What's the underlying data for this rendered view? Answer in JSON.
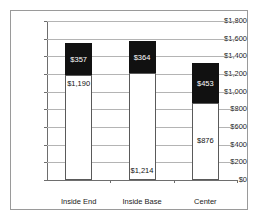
{
  "chart_data": {
    "type": "bar",
    "subtype": "stacked-bar",
    "title": "",
    "xlabel": "",
    "ylabel": "",
    "categories": [
      "Inside End",
      "Inside Base",
      "Center"
    ],
    "series": [
      {
        "name": "lower-segment",
        "color": "#ffffff",
        "values": [
          1190,
          1214,
          876
        ],
        "value_labels": [
          "$1,190",
          "$1,214",
          "$876"
        ]
      },
      {
        "name": "upper-segment",
        "color": "#111111",
        "values": [
          357,
          364,
          453
        ],
        "value_labels": [
          "$357",
          "$364",
          "$453"
        ]
      }
    ],
    "totals": [
      1547,
      1578,
      1329
    ],
    "ylim": [
      0,
      1800
    ],
    "ytick_step": 200,
    "ytick_labels": [
      "$1,800",
      "$1,600",
      "$1,400",
      "$1,200",
      "$1,000",
      "$800",
      "$600",
      "$400",
      "$200",
      "$0"
    ],
    "ytick_values": [
      1800,
      1600,
      1400,
      1200,
      1000,
      800,
      600,
      400,
      200,
      0
    ],
    "grid": true,
    "legend": false,
    "legend_position": "none",
    "axis_color": "#6e6e6e",
    "grid_color": "#b4b4b4",
    "border_color": "#9a9a9a",
    "plot_background": "#ffffff"
  }
}
